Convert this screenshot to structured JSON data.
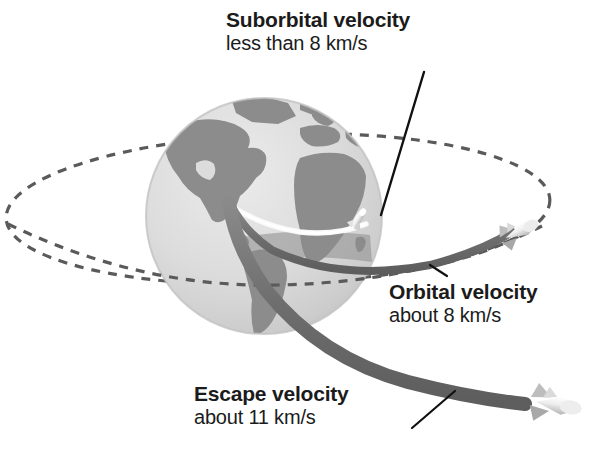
{
  "diagram": {
    "background_color": "#ffffff",
    "globe": {
      "name": "earth-globe",
      "ocean_color": "#dcdcdc",
      "land_color": "#8c8c8c",
      "center_x": 264,
      "center_y": 216,
      "radius": 118
    },
    "orbit_ellipse": {
      "name": "dashed-orbit-ellipse",
      "style": "dashed",
      "color": "#5a5a5a"
    },
    "trajectories": [
      {
        "id": "suborbital",
        "name": "suborbital-trajectory",
        "color": "#f2f2f2",
        "stroke_width": 5,
        "description": "short arc over the globe"
      },
      {
        "id": "orbital",
        "name": "orbital-trajectory",
        "color": "#6e6e6e",
        "stroke_width": 7,
        "description": "curve leaving to the right around the globe"
      },
      {
        "id": "escape",
        "name": "escape-trajectory",
        "color": "#6e6e6e",
        "stroke_width": 13,
        "description": "thick straight band leaving to the lower right"
      }
    ],
    "rockets": [
      {
        "id": "suborbital-rocket",
        "name": "rocket-suborbital",
        "color": "#f4f4f4"
      },
      {
        "id": "orbital-rocket",
        "name": "rocket-orbital",
        "color": "#cfcfcf"
      },
      {
        "id": "escape-rocket",
        "name": "rocket-escape",
        "color": "#d6d6d6"
      }
    ],
    "labels": [
      {
        "id": "suborbital",
        "name": "label-suborbital",
        "title": "Suborbital velocity",
        "subtitle": "less than 8 km/s",
        "leader_line": true
      },
      {
        "id": "orbital",
        "name": "label-orbital",
        "title": "Orbital velocity",
        "subtitle": "about 8 km/s",
        "leader_line": true
      },
      {
        "id": "escape",
        "name": "label-escape",
        "title": "Escape velocity",
        "subtitle": "about 11 km/s",
        "leader_line": true
      }
    ],
    "colors": {
      "text": "#1b1b1b",
      "leader_line": "#111111",
      "trail_gray": "#6e6e6e",
      "globe_light": "#dcdcdc",
      "globe_dark": "#8c8c8c"
    }
  }
}
